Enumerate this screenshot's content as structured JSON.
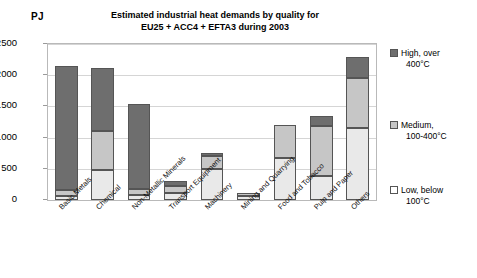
{
  "chart_data": {
    "type": "bar",
    "stacked": true,
    "title": "Estimated industrial heat demands by quality for EU25 + ACC4 + EFTA3 during 2003",
    "title_line1": "Estimated industrial heat demands by quality for",
    "title_line2": "EU25 + ACC4 + EFTA3 during 2003",
    "unit_label": "PJ",
    "xlabel": "",
    "ylabel": "PJ",
    "ylim": [
      0,
      2500
    ],
    "yticks": [
      0,
      500,
      1000,
      1500,
      2000,
      2500
    ],
    "ytick_labels": [
      "0",
      "500",
      "1000",
      "1500",
      "2000",
      "2500"
    ],
    "grid": true,
    "legend_position": "right",
    "categories": [
      "Basic Metals",
      "Chemical",
      "Non-Metallic Minerals",
      "Transport Equipment",
      "Machinery",
      "Mining and Quarrying",
      "Food and Tobacco",
      "Pulp and Paper",
      "Others"
    ],
    "series": [
      {
        "name": "Low, below 100°C",
        "color": "#e9e9e9",
        "values": [
          60,
          480,
          80,
          110,
          490,
          60,
          680,
          380,
          1160
        ]
      },
      {
        "name": "Medium, 100-400°C",
        "color": "#c6c6c6",
        "values": [
          100,
          620,
          90,
          110,
          220,
          50,
          520,
          800,
          790
        ]
      },
      {
        "name": "High, over 400°C",
        "color": "#6e6e6e",
        "values": [
          1990,
          1010,
          1375,
          80,
          50,
          0,
          0,
          160,
          340
        ]
      }
    ],
    "totals": [
      2150,
      2110,
      1545,
      300,
      760,
      110,
      1200,
      1340,
      2290
    ]
  },
  "legend": {
    "items": [
      {
        "label_line1": "High, over",
        "label_line2": "400°C",
        "swatch": "high"
      },
      {
        "label_line1": "Medium,",
        "label_line2": "100-400°C",
        "swatch": "med"
      },
      {
        "label_line1": "Low, below",
        "label_line2": "100°C",
        "swatch": "low"
      }
    ]
  }
}
